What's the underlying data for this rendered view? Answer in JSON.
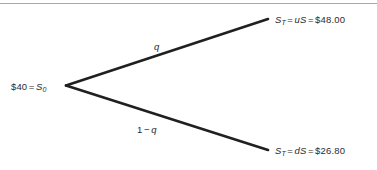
{
  "figure": {
    "type": "binomial-tree-diagram",
    "width": 377,
    "height": 170,
    "background_color": "#ffffff",
    "rule_color": "#a8a8a8",
    "line_color": "#202020",
    "text_color": "#2b2b2b"
  },
  "root": {
    "price_text": "$40",
    "equals": "=",
    "symbol": "S",
    "subscript": "0"
  },
  "branches": {
    "up": {
      "probability_label": "q",
      "from": [
        66,
        85
      ],
      "to": [
        268,
        19
      ]
    },
    "down": {
      "probability_one": "1",
      "probability_minus": "−",
      "probability_label": "q",
      "from": [
        66,
        85
      ],
      "to": [
        268,
        150
      ]
    }
  },
  "terminals": {
    "up": {
      "symbol": "S",
      "subscript": "T",
      "equals_1": "=",
      "factor": "uS",
      "equals_2": "=",
      "value": "$48.00"
    },
    "down": {
      "symbol": "S",
      "subscript": "T",
      "equals_1": "=",
      "factor": "dS",
      "equals_2": "=",
      "value": "$26.80"
    }
  }
}
